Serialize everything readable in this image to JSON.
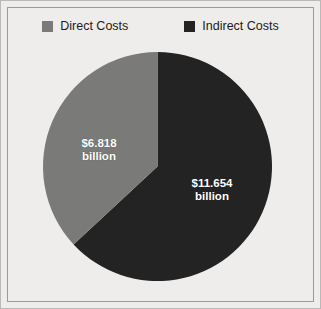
{
  "chart_data": {
    "type": "pie",
    "title": "",
    "subtitle": "",
    "categories": [
      "Direct Costs",
      "Indirect Costs"
    ],
    "values": [
      6.818,
      11.654
    ],
    "value_labels": [
      "$6.818 billion",
      "$11.654 billion"
    ],
    "units": "billion USD",
    "total": 18.472,
    "percentages": [
      36.9,
      63.1
    ],
    "colors": [
      "#7a7a78",
      "#232323"
    ],
    "legend_position": "top",
    "grid": false,
    "start_angle_deg": 0,
    "direction": "clockwise",
    "slices": [
      {
        "name": "Indirect Costs",
        "value": 11.654,
        "percent": 63.1,
        "color": "#232323",
        "label_line1": "$11.654",
        "label_line2": "billion"
      },
      {
        "name": "Direct Costs",
        "value": 6.818,
        "percent": 36.9,
        "color": "#7a7a78",
        "label_line1": "$6.818",
        "label_line2": "billion"
      }
    ]
  },
  "legend": {
    "items": [
      {
        "label": "Direct Costs",
        "color": "#7a7a78"
      },
      {
        "label": "Indirect Costs",
        "color": "#232323"
      }
    ]
  },
  "labels": {
    "direct": {
      "line1": "$6.818",
      "line2": "billion"
    },
    "indirect": {
      "line1": "$11.654",
      "line2": "billion"
    }
  },
  "theme": {
    "background": "#eeedec",
    "frame_border": "#9a9a98",
    "outer_border": "#b9b9b7",
    "label_text": "#ffffff",
    "legend_text": "#1b1b1b"
  }
}
